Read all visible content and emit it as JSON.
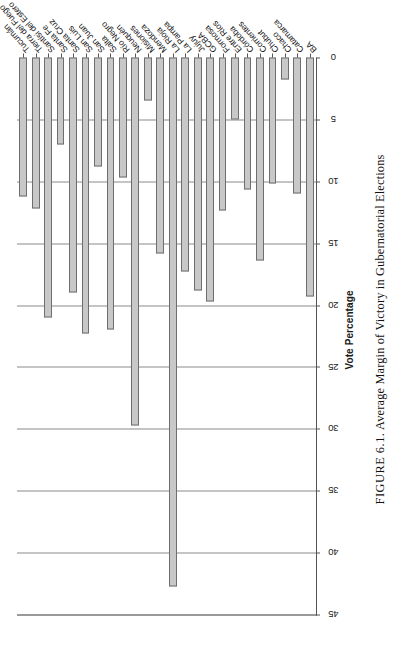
{
  "figure": {
    "caption_prefix": "FIGURE 6.1.",
    "caption_text": "Average Margin of Victory in Gubernatorial Elections"
  },
  "chart_data": {
    "type": "bar",
    "orientation": "vertical-bars-rendered-rotated",
    "title": "",
    "xlabel": "",
    "ylabel": "Vote Percentage",
    "ylim": [
      0,
      45
    ],
    "yticks": [
      0,
      5,
      10,
      15,
      20,
      25,
      30,
      35,
      40,
      45
    ],
    "grid": true,
    "legend": "none",
    "bar_fill": "#c8c8c8",
    "bar_stroke": "#6e6e6e",
    "categories": [
      "BA",
      "Catamarca",
      "Chaco",
      "Chubut",
      "Corrientes",
      "Córdoba",
      "Entre Ríos",
      "Formosa",
      "GCBA",
      "Jujuy",
      "La Pampa",
      "La Rioja",
      "Mendoza",
      "Misiones",
      "Neuquén",
      "Río Negro",
      "Salta",
      "San Juan",
      "San Luis",
      "Santa Cruz",
      "Santa Fe",
      "Santísi del Estero",
      "Tierra del Fuego",
      "Tucumán"
    ],
    "values": [
      19.3,
      11.0,
      1.8,
      10.2,
      16.4,
      10.7,
      5.0,
      12.4,
      19.7,
      18.8,
      17.3,
      42.7,
      15.8,
      3.5,
      29.7,
      9.7,
      22.0,
      8.8,
      22.3,
      19.0,
      7.0,
      21.0,
      12.2,
      11.2
    ]
  },
  "axis": {
    "tick_labels": [
      "0",
      "5",
      "10",
      "15",
      "20",
      "25",
      "30",
      "35",
      "40",
      "45"
    ],
    "y_axis_title": "Vote Percentage"
  }
}
